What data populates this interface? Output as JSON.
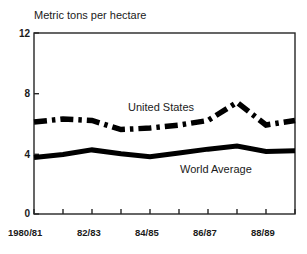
{
  "chart_data": {
    "type": "line",
    "title": "Metric tons per hectare",
    "xlabel": "",
    "ylabel": "Metric tons per hectare",
    "ylim": [
      0,
      12
    ],
    "yticks": [
      0,
      4,
      8,
      12
    ],
    "ytick_labels": [
      "0",
      "4",
      "8",
      "12"
    ],
    "grid": false,
    "legend_position": "inline-annotations",
    "x": [
      "1980/81",
      "81/82",
      "82/83",
      "83/84",
      "84/85",
      "85/86",
      "86/87",
      "87/88",
      "88/89",
      "89/90"
    ],
    "xtick_labels": [
      "1980/81",
      "82/83",
      "84/85",
      "86/87",
      "88/89"
    ],
    "xtick_indices": [
      0,
      2,
      4,
      6,
      8
    ],
    "series": [
      {
        "name": "United States",
        "style": "dash-dot",
        "color": "#000000",
        "values": [
          6.1,
          6.3,
          6.2,
          5.6,
          5.7,
          5.9,
          6.2,
          7.4,
          5.9,
          6.2
        ]
      },
      {
        "name": "World Average",
        "style": "solid",
        "color": "#000000",
        "values": [
          3.75,
          3.95,
          4.25,
          4.0,
          3.8,
          4.05,
          4.3,
          4.5,
          4.15,
          4.2
        ]
      }
    ],
    "annotations": [
      {
        "text": "United States",
        "series": "United States"
      },
      {
        "text": "World Average",
        "series": "World Average"
      }
    ]
  },
  "figure": {
    "title": "Metric tons per hectare",
    "axis_color": "#262626",
    "line_color": "#000000",
    "background": "#ffffff"
  }
}
